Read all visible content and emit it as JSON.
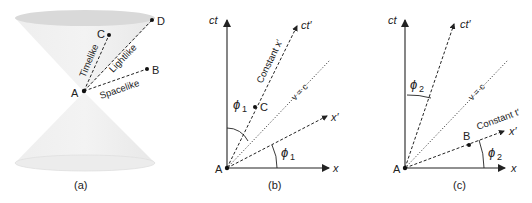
{
  "panels": {
    "a": {
      "caption": "(a)",
      "points": {
        "A": "A",
        "B": "B",
        "C": "C",
        "D": "D"
      },
      "intervals": {
        "timelike": "Timelike",
        "lightlike": "Lightlike",
        "spacelike": "Spacelike"
      }
    },
    "b": {
      "caption": "(b)",
      "axes": {
        "ct": "ct",
        "x": "x",
        "ct_prime": "ct′",
        "x_prime": "x′"
      },
      "lines": {
        "light": "v = c",
        "constant": "Constant x′"
      },
      "angle": "ϕ",
      "angle_sub": "1",
      "points": {
        "A": "A",
        "C": "C"
      }
    },
    "c": {
      "caption": "(c)",
      "axes": {
        "ct": "ct",
        "x": "x",
        "ct_prime": "ct′",
        "x_prime": "x′"
      },
      "lines": {
        "light": "v = c",
        "constant": "Constant t′"
      },
      "angle": "ϕ",
      "angle_sub": "2",
      "points": {
        "A": "A",
        "B": "B"
      }
    }
  },
  "colors": {
    "line": "#222222",
    "cone": "#e6e6e6",
    "cone_rim": "#cfcfcf"
  }
}
